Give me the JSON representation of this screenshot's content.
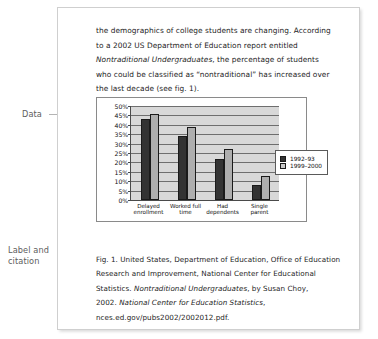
{
  "annotations": {
    "data_label": "Data",
    "caption_label": "Label and\ncitation"
  },
  "document": {
    "paragraph": {
      "part1": "the demographics of college students are changing. According to a 2002 US Department of Education report entitled ",
      "title_italic_1": "Nontraditional Undergraduates",
      "part2": ", the percentage of students who could be classified as “nontraditional” has increased over the last decade (see fig. 1)."
    },
    "citation": {
      "line1": "Fig. 1. United States, Department of Education, Office of Education",
      "line2": "Research and Improvement, National Center for Educational",
      "line3_pre": "Statistics. ",
      "line3_italic": "Nontraditional Undergraduates",
      "line3_post": ", by Susan Choy,",
      "line4_pre": "2002. ",
      "line4_italic": "National Center for Education Statistics",
      "line4_post": ",",
      "line5": "nces.ed.gov/pubs2002/2002012.pdf."
    }
  },
  "chart_data": {
    "type": "bar",
    "title": "",
    "xlabel": "",
    "ylabel": "",
    "categories": [
      "Delayed enrollment",
      "Worked full time",
      "Had dependents",
      "Single parent"
    ],
    "series": [
      {
        "name": "1992–93",
        "values": [
          43,
          34,
          22,
          8
        ],
        "color": "#333333"
      },
      {
        "name": "1999–2000",
        "values": [
          46,
          39,
          27,
          13
        ],
        "color": "#aeaeae"
      }
    ],
    "ylim": [
      0,
      50
    ],
    "ytick_step": 5,
    "ytick_labels": [
      "50%",
      "45%",
      "40%",
      "35%",
      "30%",
      "25%",
      "20%",
      "15%",
      "10%",
      "5%",
      "0%"
    ],
    "grid": true,
    "legend_position": "inside-right",
    "plot_background": "#d8d8d8"
  }
}
